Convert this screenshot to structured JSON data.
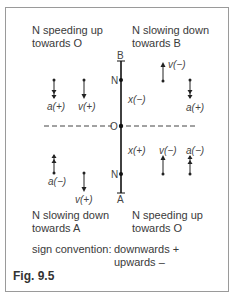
{
  "quadrants": {
    "top_left": {
      "line1": "N speeding up",
      "line2": "towards O"
    },
    "top_right": {
      "line1": "N slowing down",
      "line2": "towards B"
    },
    "bottom_left": {
      "line1": "N slowing down",
      "line2": "towards A"
    },
    "bottom_right": {
      "line1": "N speeding up",
      "line2": "towards O"
    }
  },
  "axis": {
    "top_end": "B",
    "bottom_end": "A",
    "origin": "O",
    "upper_point": "N",
    "lower_point": "N"
  },
  "labels": {
    "tl_a": "a(+)",
    "tl_v": "v(+)",
    "tr_v": "v(−)",
    "tr_a": "a(+)",
    "x_upper": "x(−)",
    "x_lower": "x(+)",
    "br_v": "v(−)",
    "br_a": "a(−)",
    "bl_a": "a(−)",
    "bl_v": "v(+)"
  },
  "sign_convention": {
    "label": "sign convention:",
    "down": "downwards +",
    "up": "upwards –"
  },
  "caption": "Fig. 9.5"
}
